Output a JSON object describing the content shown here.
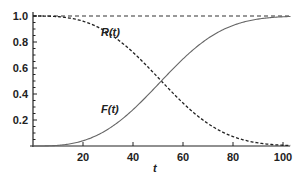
{
  "chart_data": {
    "type": "line",
    "title": "",
    "xlabel": "t",
    "ylabel": "",
    "xlim": [
      0,
      103
    ],
    "ylim": [
      0,
      1.0
    ],
    "grid": false,
    "legend": "none (inline curve labels)",
    "x_ticks": [
      "20",
      "40",
      "60",
      "80",
      "100"
    ],
    "y_ticks": [
      "0.2",
      "0.4",
      "0.6",
      "0.8",
      "1.0"
    ],
    "reference_line": {
      "y": 1.0,
      "style": "dashed"
    },
    "annotations": [
      {
        "text": "R(t)",
        "x": 48,
        "y": 0.85
      },
      {
        "text": "F(t)",
        "x": 40,
        "y": 0.25
      }
    ],
    "series": [
      {
        "name": "R(t)",
        "style": "dashed",
        "x": [
          0,
          10,
          20,
          30,
          40,
          50,
          60,
          70,
          80,
          90,
          100
        ],
        "values": [
          1.0,
          0.995,
          0.96,
          0.87,
          0.72,
          0.53,
          0.33,
          0.17,
          0.07,
          0.02,
          0.0
        ]
      },
      {
        "name": "F(t)",
        "style": "solid",
        "x": [
          0,
          10,
          20,
          30,
          40,
          50,
          60,
          70,
          80,
          90,
          100
        ],
        "values": [
          0.0,
          0.005,
          0.04,
          0.13,
          0.28,
          0.47,
          0.67,
          0.83,
          0.93,
          0.98,
          1.0
        ]
      }
    ]
  },
  "axis": {
    "x_label": "t",
    "x_ticks": [
      "20",
      "40",
      "60",
      "80",
      "100"
    ],
    "y_ticks": [
      "0.2",
      "0.4",
      "0.6",
      "0.8",
      "1.0"
    ]
  },
  "labels": {
    "r_curve": "R(t)",
    "f_curve": "F(t)"
  }
}
